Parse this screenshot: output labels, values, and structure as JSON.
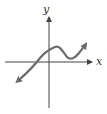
{
  "graph": {
    "x_label": "x",
    "y_label": "y",
    "axis_color": "#444444",
    "curve_color": "#6b6b6b",
    "description": "Cubic-like curve rising from lower left, local maximum just right of y-axis above x-axis, local minimum above x-axis, then rising to upper right; arrows on both ends"
  }
}
